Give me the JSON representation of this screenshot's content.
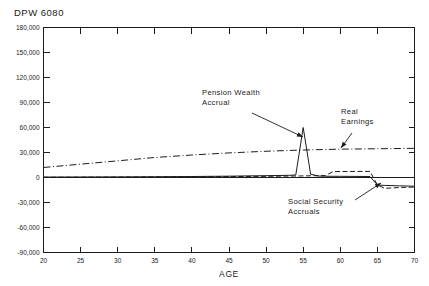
{
  "chart_data": {
    "type": "line",
    "title": "DPW 6080",
    "xlabel": "AGE",
    "ylabel": "",
    "xlim": [
      20,
      70
    ],
    "ylim": [
      -90000,
      180000
    ],
    "grid": false,
    "legend_position": "none",
    "x_ticks": [
      "20",
      "25",
      "30",
      "35",
      "40",
      "45",
      "50",
      "55",
      "60",
      "65",
      "70"
    ],
    "x_tick_values": [
      20,
      25,
      30,
      35,
      40,
      45,
      50,
      55,
      60,
      65,
      70
    ],
    "y_ticks": [
      "180,000",
      "150,000",
      "120,000",
      "90,000",
      "60,000",
      "30,000",
      "0",
      "-30,000",
      "-60,000",
      "-90,000"
    ],
    "y_tick_values": [
      180000,
      150000,
      120000,
      90000,
      60000,
      30000,
      0,
      -30000,
      -60000,
      -90000
    ],
    "series": [
      {
        "name": "Real Earnings",
        "style": "dash-dot",
        "x": [
          20,
          25,
          30,
          35,
          40,
          45,
          50,
          55,
          60,
          65,
          70
        ],
        "values": [
          12000,
          16000,
          20000,
          24000,
          27000,
          29500,
          31500,
          33000,
          34000,
          34500,
          35000
        ]
      },
      {
        "name": "Pension Wealth Accrual",
        "style": "solid",
        "x": [
          20,
          25,
          30,
          35,
          40,
          45,
          50,
          53,
          54,
          55,
          56,
          57,
          58,
          60,
          62,
          64,
          65,
          66,
          68,
          70
        ],
        "values": [
          500,
          600,
          700,
          900,
          1200,
          1600,
          2200,
          2600,
          3000,
          60000,
          4000,
          1800,
          1500,
          1400,
          1300,
          1200,
          -9000,
          -9500,
          -10000,
          -10500
        ]
      },
      {
        "name": "Social Security Accruals",
        "style": "dashed",
        "x": [
          20,
          25,
          30,
          35,
          40,
          45,
          50,
          55,
          58,
          59,
          60,
          62,
          64,
          65,
          66,
          67,
          68,
          70
        ],
        "values": [
          300,
          400,
          500,
          700,
          900,
          1100,
          1400,
          1900,
          2300,
          7000,
          7200,
          7300,
          7300,
          -9000,
          -13000,
          -12500,
          -12000,
          -11500
        ]
      }
    ],
    "annotations": [
      {
        "id": "pension-wealth-accrual",
        "lines": [
          "Pension  Wealth",
          "Accrual"
        ],
        "text_x": 202,
        "text_y": 95,
        "leader_from": [
          252,
          113
        ],
        "leader_to": [
          303,
          137
        ]
      },
      {
        "id": "real-earnings",
        "lines": [
          "Real",
          "Earnings"
        ],
        "text_x": 341,
        "text_y": 114,
        "leader_from": [
          352,
          133
        ],
        "leader_to": [
          341,
          148
        ]
      },
      {
        "id": "social-security-accruals",
        "lines": [
          "Social  Security",
          "Accruals"
        ],
        "text_x": 288,
        "text_y": 204,
        "leader_from": [
          355,
          200
        ],
        "leader_to": [
          381,
          183
        ]
      }
    ]
  }
}
